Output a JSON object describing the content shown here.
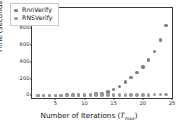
{
  "chart_data": {
    "type": "scatter",
    "title": "",
    "xlabel": "Number of Iterations (T_max)",
    "xlabel_main": "Number of Iterations (",
    "xlabel_var": "T",
    "xlabel_sub": "max",
    "xlabel_close": ")",
    "ylabel": "Time (seconds)",
    "xlim": [
      1,
      25
    ],
    "ylim": [
      -30,
      1040
    ],
    "xticks": [
      5,
      10,
      15,
      20,
      25
    ],
    "yticks": [
      0,
      200,
      400,
      600,
      800,
      1000
    ],
    "grid": false,
    "legend_position": "upper left",
    "marker": "circle",
    "series": [
      {
        "name": "RnnVerify",
        "color": "#7d7d7d",
        "x": [
          2,
          3,
          4,
          5,
          6,
          7,
          8,
          9,
          10,
          11,
          12,
          13,
          14,
          15,
          16,
          17,
          18,
          19,
          20,
          21,
          22,
          23,
          24
        ],
        "values": [
          1,
          1,
          2,
          2,
          3,
          4,
          5,
          6,
          8,
          11,
          16,
          25,
          42,
          70,
          110,
          160,
          215,
          275,
          340,
          420,
          520,
          660,
          830
        ]
      },
      {
        "name": "RNSVerify",
        "color": "#9a9a9a",
        "x": [
          2,
          3,
          4,
          5,
          6,
          7,
          8,
          9,
          10,
          11,
          12,
          13,
          14,
          15,
          16,
          17,
          18,
          19,
          20,
          21,
          22,
          23,
          24
        ],
        "values": [
          1,
          1,
          1,
          1,
          1,
          2,
          2,
          2,
          3,
          3,
          4,
          4,
          5,
          5,
          6,
          6,
          7,
          7,
          8,
          8,
          9,
          9,
          10
        ]
      }
    ]
  },
  "legend": {
    "entries": [
      {
        "label": "RnnVerify"
      },
      {
        "label": "RNSVerify"
      }
    ]
  }
}
